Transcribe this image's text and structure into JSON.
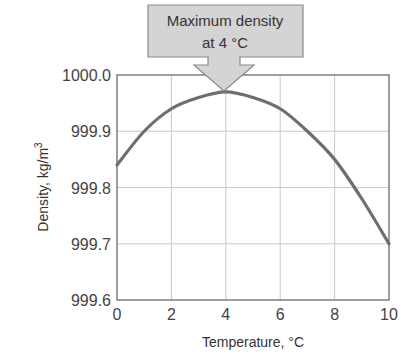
{
  "chart_data": {
    "type": "line",
    "title": "",
    "xlabel": "Temperature, °C",
    "ylabel": "Density, kg/m",
    "ylabel_superscript": "3",
    "xlim": [
      0,
      10
    ],
    "ylim": [
      999.6,
      1000.0
    ],
    "x_ticks": [
      "0",
      "2",
      "4",
      "6",
      "8",
      "10"
    ],
    "y_ticks": [
      "999.6",
      "999.7",
      "999.8",
      "999.9",
      "1000.0"
    ],
    "grid": true,
    "legend": null,
    "x": [
      0,
      1,
      2,
      3,
      4,
      5,
      6,
      7,
      8,
      9,
      10
    ],
    "series": [
      {
        "name": "Density of water",
        "values": [
          999.84,
          999.9,
          999.94,
          999.96,
          999.97,
          999.96,
          999.94,
          999.9,
          999.85,
          999.78,
          999.7
        ],
        "color": "#6e6e6e"
      }
    ],
    "annotations": [
      {
        "text_line1": "Maximum density",
        "text_line2": "at 4 °C",
        "x": 4,
        "y": 999.97,
        "style": "arrow-callout"
      }
    ]
  },
  "colors": {
    "curve": "#6e6e6e",
    "grid": "#c8c8c8",
    "frame": "#6a6a6a",
    "callout_fill": "#d4d4d4",
    "callout_stroke": "#8a8a8a"
  }
}
